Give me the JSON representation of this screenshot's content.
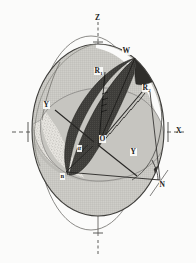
{
  "figure": {
    "background_color": "#fbfbfa",
    "ink_color": "#1b1b1b",
    "shade_light_gray": "#c9c8c4",
    "shade_stipple": "#d9d8d3",
    "shade_dark": "#3b3a38",
    "outline_color": "#4a4a48"
  },
  "axes": {
    "z_top_label": "Z",
    "z_bottom_label": "",
    "x_right_label": "X",
    "x_left_label": "",
    "y_label": "Y",
    "y_prime_label": "Y"
  },
  "points": {
    "origin": "O",
    "w": "W",
    "n_upper_right": "N",
    "n_lower_left": "n",
    "r1": "R",
    "r1_sub": "1",
    "r2": "R",
    "r2_sub": "2",
    "alpha": "α"
  },
  "geometry": {
    "sphere_center_x": 98,
    "sphere_center_y": 130,
    "sphere_rx": 66,
    "sphere_ry": 86,
    "outer_ellipse_rx": 53,
    "outer_ellipse_ry": 97,
    "tick_count": 6
  }
}
